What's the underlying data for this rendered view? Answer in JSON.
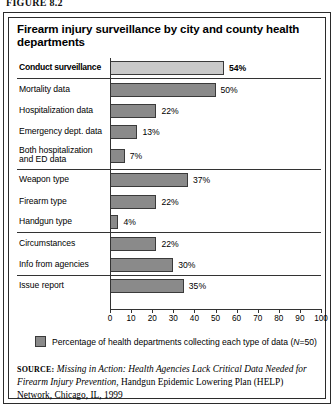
{
  "figure_label": "FIGURE 8.2",
  "chart_title": "Firearm injury surveillance by city and county health departments",
  "legend": {
    "text_before": "Percentage of health departments collecting each type of data (",
    "n_italic": "N",
    "text_after": "=50)",
    "swatch_color": "#8a8a8a"
  },
  "source": {
    "label": "SOURCE:",
    "italic_title": "Missing in Action: Health Agencies Lack Critical Data Needed for Firearm Injury Prevention",
    "rest": ", Handgun Epidemic Lowering Plan (HELP) Network, Chicago, IL, 1999"
  },
  "chart_data": {
    "type": "bar",
    "orientation": "horizontal",
    "title": "Firearm injury surveillance by city and county health departments",
    "xlabel": "",
    "ylabel": "",
    "xlim": [
      0,
      100
    ],
    "xticks": [
      0,
      10,
      20,
      30,
      40,
      50,
      60,
      70,
      80,
      90,
      100
    ],
    "grid": false,
    "legend_position": "below-axis",
    "unit": "%",
    "categories": [
      "Conduct surveillance",
      "Mortality data",
      "Hospitalization data",
      "Emergency dept. data",
      "Both hospitalization\nand ED data",
      "Weapon type",
      "Firearm type",
      "Handgun type",
      "Circumstances",
      "Info from agencies",
      "Issue report"
    ],
    "values": [
      54,
      50,
      22,
      13,
      7,
      37,
      22,
      4,
      22,
      30,
      35
    ],
    "value_labels": [
      "54%",
      "50%",
      "22%",
      "13%",
      "7%",
      "37%",
      "22%",
      "4%",
      "22%",
      "30%",
      "35%"
    ],
    "bar_colors": [
      "#c9c9c9",
      "#8a8a8a",
      "#8a8a8a",
      "#8a8a8a",
      "#8a8a8a",
      "#8a8a8a",
      "#8a8a8a",
      "#8a8a8a",
      "#8a8a8a",
      "#8a8a8a",
      "#8a8a8a"
    ],
    "emphasized_category": "Conduct surveillance",
    "group_separators_after": [
      "Conduct surveillance",
      "Both hospitalization\nand ED data",
      "Handgun type",
      "Info from agencies"
    ]
  }
}
